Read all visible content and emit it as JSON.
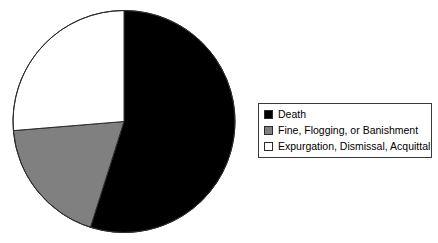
{
  "chart_data": {
    "type": "pie",
    "title": "",
    "categories": [
      "Death",
      "Fine, Flogging, or Banishment",
      "Expurgation, Dismissal, Acquittal"
    ],
    "values": [
      54.9,
      18.8,
      26.3
    ],
    "value_unit": "percent",
    "start_angle_deg": 0,
    "direction": "clockwise",
    "slices": [
      {
        "label": "Death",
        "percent": 54.9,
        "color": "#000000",
        "start_angle_deg": 0.0,
        "end_angle_deg": 197.6
      },
      {
        "label": "Fine, Flogging, or Banishment",
        "percent": 18.8,
        "color": "#808080",
        "start_angle_deg": 197.6,
        "end_angle_deg": 265.3
      },
      {
        "label": "Expurgation, Dismissal, Acquittal",
        "percent": 26.3,
        "color": "#ffffff",
        "start_angle_deg": 265.3,
        "end_angle_deg": 360.0
      }
    ],
    "legend_position": "right",
    "grid": false,
    "xlabel": "",
    "ylabel": ""
  },
  "legend": {
    "items": [
      {
        "label": "Death",
        "color": "#000000"
      },
      {
        "label": "Fine, Flogging, or Banishment",
        "color": "#808080"
      },
      {
        "label": "Expurgation, Dismissal, Acquittal",
        "color": "#ffffff"
      }
    ]
  },
  "colors": {
    "background": "#ffffff",
    "outline": "#2b2b2b",
    "legend_border": "#3a3a3a",
    "death": "#000000",
    "fine": "#808080",
    "expurgation": "#ffffff"
  }
}
